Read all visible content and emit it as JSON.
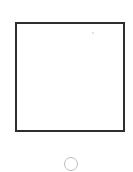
{
  "device": {
    "screen": {
      "content": "",
      "border_color": "#2e2e2e",
      "background": "#ffffff"
    },
    "home_button": {
      "icon": "circle-outline-icon",
      "stroke_color": "#bdbdbd"
    }
  }
}
